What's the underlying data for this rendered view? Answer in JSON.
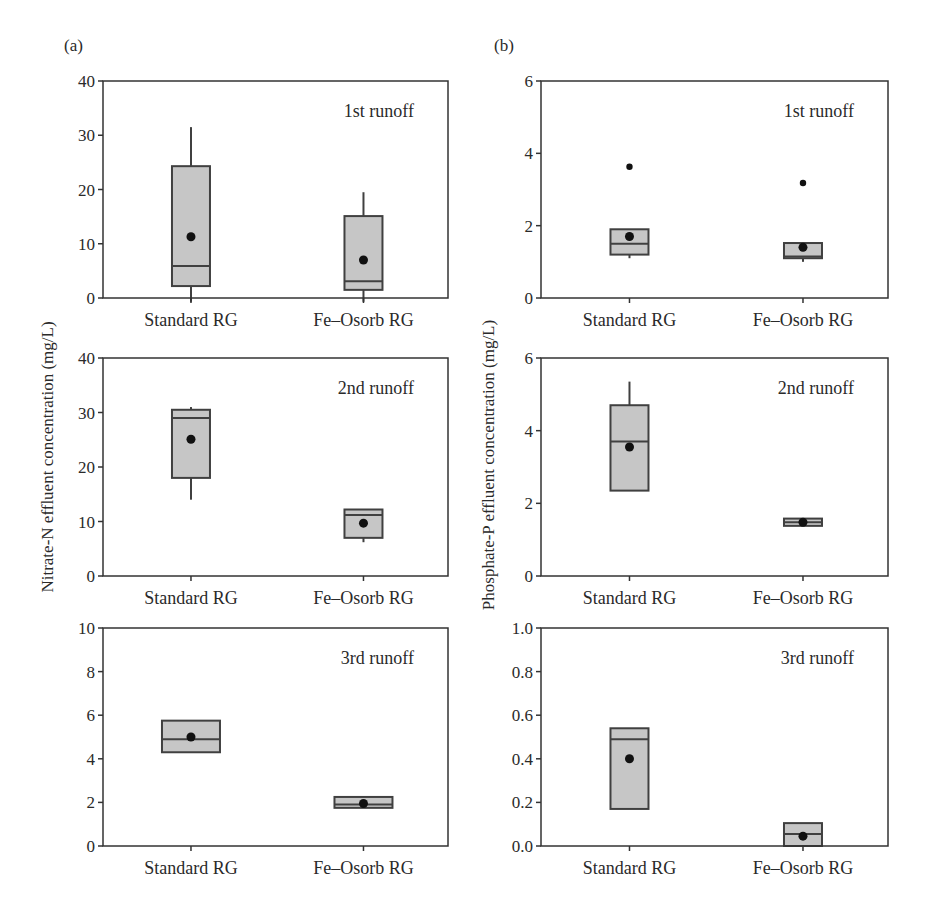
{
  "figure": {
    "panel_a_label": "(a)",
    "panel_b_label": "(b)",
    "ylabel_a": "Nitrate-N effluent concentration (mg/L)",
    "ylabel_b": "Phosphate-P effluent concentration (mg/L)",
    "colors": {
      "box_fill": "#c6c6c6",
      "box_stroke": "#404040",
      "axis": "#333333",
      "mean_dot": "#111111"
    }
  },
  "chart_data": [
    {
      "type": "box",
      "panel": "a",
      "title": "1st runoff",
      "ylabel": "Nitrate-N effluent concentration (mg/L)",
      "ylim": [
        0,
        40
      ],
      "yticks": [
        0,
        10,
        20,
        30,
        40
      ],
      "categories": [
        "Standard RG",
        "Fe–Osorb RG"
      ],
      "boxes": [
        {
          "q1": 2.2,
          "median": 5.9,
          "q3": 24.3,
          "whisker_low": -0.7,
          "whisker_high": 31.5,
          "mean": 11.3,
          "outliers": [],
          "width": 38
        },
        {
          "q1": 1.5,
          "median": 3.1,
          "q3": 15.1,
          "whisker_low": -0.7,
          "whisker_high": 19.5,
          "mean": 7.0,
          "outliers": [],
          "width": 38
        }
      ]
    },
    {
      "type": "box",
      "panel": "a",
      "title": "2nd runoff",
      "ylabel": "Nitrate-N effluent concentration (mg/L)",
      "ylim": [
        0,
        40
      ],
      "yticks": [
        0,
        10,
        20,
        30,
        40
      ],
      "categories": [
        "Standard RG",
        "Fe–Osorb RG"
      ],
      "boxes": [
        {
          "q1": 18.0,
          "median": 29.0,
          "q3": 30.5,
          "whisker_low": 14.0,
          "whisker_high": 31.0,
          "mean": 25.1,
          "outliers": [],
          "width": 38
        },
        {
          "q1": 7.0,
          "median": 11.2,
          "q3": 12.2,
          "whisker_low": 6.2,
          "whisker_high": 12.2,
          "mean": 9.7,
          "outliers": [],
          "width": 38
        }
      ]
    },
    {
      "type": "box",
      "panel": "a",
      "title": "3rd runoff",
      "ylabel": "Nitrate-N effluent concentration (mg/L)",
      "ylim": [
        0,
        10
      ],
      "yticks": [
        0,
        2,
        4,
        6,
        8,
        10
      ],
      "categories": [
        "Standard RG",
        "Fe–Osorb RG"
      ],
      "boxes": [
        {
          "q1": 4.3,
          "median": 4.9,
          "q3": 5.75,
          "whisker_low": 4.3,
          "whisker_high": 5.75,
          "mean": 5.0,
          "outliers": [],
          "width": 58
        },
        {
          "q1": 1.75,
          "median": 1.9,
          "q3": 2.25,
          "whisker_low": 1.75,
          "whisker_high": 2.25,
          "mean": 1.95,
          "outliers": [],
          "width": 58
        }
      ]
    },
    {
      "type": "box",
      "panel": "b",
      "title": "1st runoff",
      "ylabel": "Phosphate-P effluent concentration (mg/L)",
      "ylim": [
        0,
        6
      ],
      "yticks": [
        0,
        2,
        4,
        6
      ],
      "tick_decimals": 0,
      "categories": [
        "Standard RG",
        "Fe–Osorb RG"
      ],
      "boxes": [
        {
          "q1": 1.2,
          "median": 1.5,
          "q3": 1.9,
          "whisker_low": 1.1,
          "whisker_high": 1.9,
          "mean": 1.7,
          "outliers": [
            3.63
          ],
          "width": 38
        },
        {
          "q1": 1.1,
          "median": 1.15,
          "q3": 1.52,
          "whisker_low": 1.0,
          "whisker_high": 1.52,
          "mean": 1.4,
          "outliers": [
            3.18
          ],
          "width": 38
        }
      ]
    },
    {
      "type": "box",
      "panel": "b",
      "title": "2nd runoff",
      "ylabel": "Phosphate-P effluent concentration (mg/L)",
      "ylim": [
        0,
        6
      ],
      "yticks": [
        0,
        2,
        4,
        6
      ],
      "tick_decimals": 0,
      "categories": [
        "Standard RG",
        "Fe–Osorb RG"
      ],
      "boxes": [
        {
          "q1": 2.35,
          "median": 3.7,
          "q3": 4.7,
          "whisker_low": 2.35,
          "whisker_high": 5.35,
          "mean": 3.55,
          "outliers": [],
          "width": 38
        },
        {
          "q1": 1.38,
          "median": 1.48,
          "q3": 1.58,
          "whisker_low": 1.38,
          "whisker_high": 1.58,
          "mean": 1.48,
          "outliers": [],
          "width": 38
        }
      ]
    },
    {
      "type": "box",
      "panel": "b",
      "title": "3rd runoff",
      "ylabel": "Phosphate-P effluent concentration (mg/L)",
      "ylim": [
        0,
        1.0
      ],
      "yticks": [
        0.0,
        0.2,
        0.4,
        0.6,
        0.8,
        1.0
      ],
      "tick_decimals": 1,
      "categories": [
        "Standard RG",
        "Fe–Osorb RG"
      ],
      "boxes": [
        {
          "q1": 0.17,
          "median": 0.49,
          "q3": 0.54,
          "whisker_low": 0.17,
          "whisker_high": 0.54,
          "mean": 0.4,
          "outliers": [],
          "width": 38
        },
        {
          "q1": 0.0,
          "median": 0.055,
          "q3": 0.105,
          "whisker_low": 0.0,
          "whisker_high": 0.105,
          "mean": 0.045,
          "outliers": [],
          "width": 38
        }
      ]
    }
  ]
}
